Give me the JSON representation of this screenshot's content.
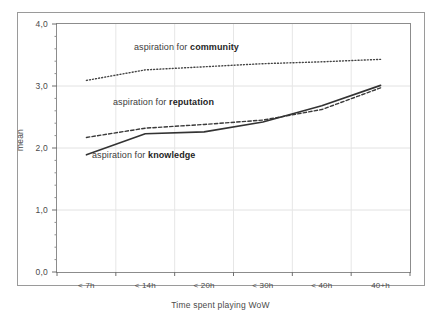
{
  "chart_data": {
    "type": "line",
    "title": "",
    "xlabel": "Time spent playing WoW",
    "ylabel": "mean",
    "categories": [
      "< 7h",
      "< 14h",
      "< 20h",
      "< 30h",
      "< 40h",
      "40+h"
    ],
    "ylim": [
      0.0,
      4.0
    ],
    "yticks": [
      "0,0",
      "1,0",
      "2,0",
      "3,0",
      "4,0"
    ],
    "ytick_values": [
      0.0,
      1.0,
      2.0,
      3.0,
      4.0
    ],
    "yminor_ticks": [
      0.2,
      0.4,
      0.6,
      0.8,
      1.2,
      1.4,
      1.6,
      1.8,
      2.2,
      2.4,
      2.6,
      2.8,
      3.2,
      3.4,
      3.6,
      3.8
    ],
    "grid": true,
    "legend_position": "inline-annotations",
    "series": [
      {
        "name": "aspiration for community",
        "style": "dotted",
        "color": "#444444",
        "values": [
          3.09,
          3.26,
          3.31,
          3.36,
          3.39,
          3.43
        ]
      },
      {
        "name": "aspiration for reputation",
        "style": "dashed",
        "color": "#3a3a3a",
        "values": [
          2.17,
          2.32,
          2.38,
          2.45,
          2.62,
          2.97
        ]
      },
      {
        "name": "aspiration for knowledge",
        "style": "solid",
        "color": "#333333",
        "values": [
          1.89,
          2.23,
          2.26,
          2.42,
          2.68,
          3.01
        ]
      }
    ],
    "annotations": [
      {
        "prefix": "aspiration for ",
        "bold": "community"
      },
      {
        "prefix": "aspiration for ",
        "bold": "reputation"
      },
      {
        "prefix": "aspiration for ",
        "bold": "knowledge"
      }
    ]
  }
}
